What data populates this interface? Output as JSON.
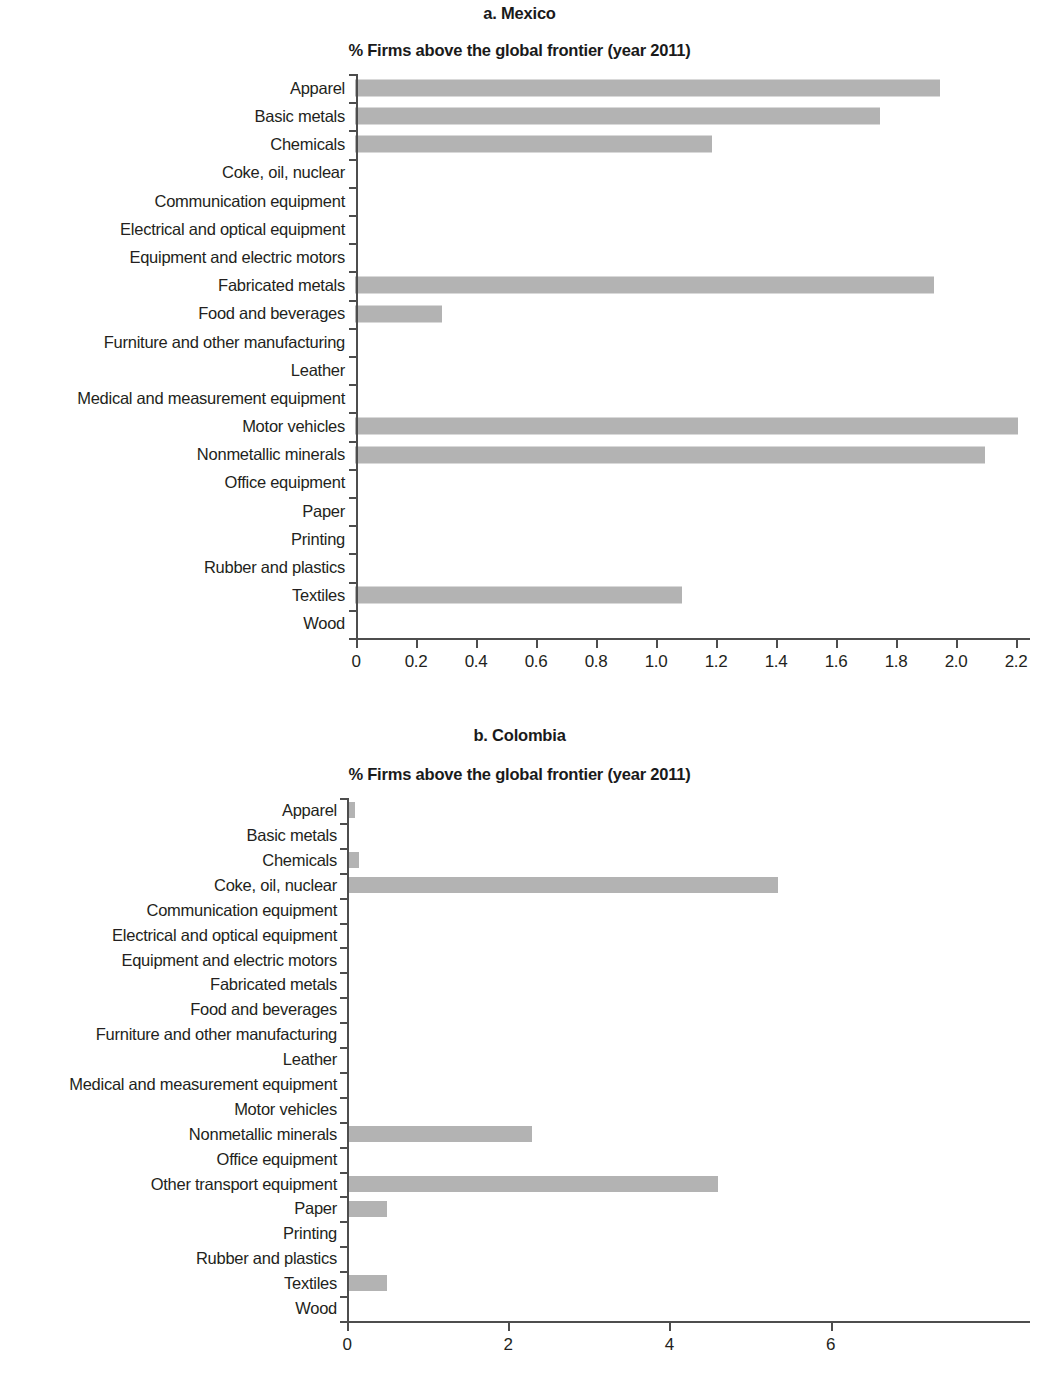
{
  "figure": {
    "bar_color": "#b3b3b3",
    "axis_color": "#4d4d4d",
    "text_color": "#231f20"
  },
  "panels": [
    {
      "id": "a",
      "title": "a. Mexico",
      "subtitle": "% Firms above the global frontier (year 2011)"
    },
    {
      "id": "b",
      "title": "b. Colombia",
      "subtitle": "% Firms above the global frontier (year 2011)"
    }
  ],
  "chart_data": [
    {
      "type": "bar",
      "orientation": "horizontal",
      "title": "a. Mexico",
      "subtitle": "% Firms above the global frontier (year 2011)",
      "xlabel": "",
      "ylabel": "",
      "xlim": [
        0,
        2.3
      ],
      "xticks": [
        0,
        0.2,
        0.4,
        0.6,
        0.8,
        1.0,
        1.2,
        1.4,
        1.6,
        1.8,
        2.0,
        2.2
      ],
      "xticklabels": [
        "0",
        "0.2",
        "0.4",
        "0.6",
        "0.8",
        "1.0",
        "1.2",
        "1.4",
        "1.6",
        "1.8",
        "2.0",
        "2.2"
      ],
      "grid": false,
      "legend": false,
      "categories": [
        "Apparel",
        "Basic metals",
        "Chemicals",
        "Coke, oil, nuclear",
        "Communication equipment",
        "Electrical and optical equipment",
        "Equipment and electric motors",
        "Fabricated metals",
        "Food and beverages",
        "Furniture and other manufacturing",
        "Leather",
        "Medical and measurement equipment",
        "Motor vehicles",
        "Nonmetallic minerals",
        "Office equipment",
        "Paper",
        "Printing",
        "Rubber and plastics",
        "Textiles",
        "Wood"
      ],
      "values": [
        1.95,
        1.75,
        1.19,
        0,
        0,
        0,
        0,
        1.93,
        0.29,
        0,
        0,
        0,
        2.21,
        2.1,
        0,
        0,
        0,
        0,
        1.09,
        0
      ]
    },
    {
      "type": "bar",
      "orientation": "horizontal",
      "title": "b. Colombia",
      "subtitle": "% Firms above the global frontier (year 2011)",
      "xlabel": "",
      "ylabel": "",
      "xlim": [
        0,
        6.3
      ],
      "xticks": [
        0,
        2,
        4,
        6
      ],
      "xticklabels": [
        "0",
        "2",
        "4",
        "6"
      ],
      "grid": false,
      "legend": false,
      "categories": [
        "Apparel",
        "Basic metals",
        "Chemicals",
        "Coke, oil, nuclear",
        "Communication equipment",
        "Electrical and optical equipment",
        "Equipment and electric motors",
        "Fabricated metals",
        "Food and beverages",
        "Furniture and other manufacturing",
        "Leather",
        "Medical and measurement equipment",
        "Motor vehicles",
        "Nonmetallic minerals",
        "Office equipment",
        "Other transport equipment",
        "Paper",
        "Printing",
        "Rubber and plastics",
        "Textiles",
        "Wood"
      ],
      "values": [
        0.1,
        0,
        0.15,
        5.35,
        0,
        0,
        0,
        0,
        0,
        0,
        0,
        0,
        0,
        2.3,
        0,
        4.6,
        0.5,
        0,
        0,
        0.5,
        0
      ]
    }
  ]
}
